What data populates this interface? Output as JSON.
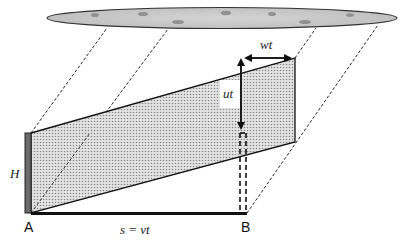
{
  "diagram": {
    "type": "physics-schematic",
    "labels": {
      "height": "H",
      "point_a": "A",
      "point_b": "B",
      "distance": "s = vt",
      "horizontal_shift": "wt",
      "vertical_shift": "ut"
    },
    "colors": {
      "cloud_fill": "#c8c8c8",
      "cloud_stroke": "#333333",
      "wall_fill": "#6a6a6a",
      "band_fill": "#d2d2d2",
      "line": "#111111",
      "background": "#ffffff"
    }
  }
}
